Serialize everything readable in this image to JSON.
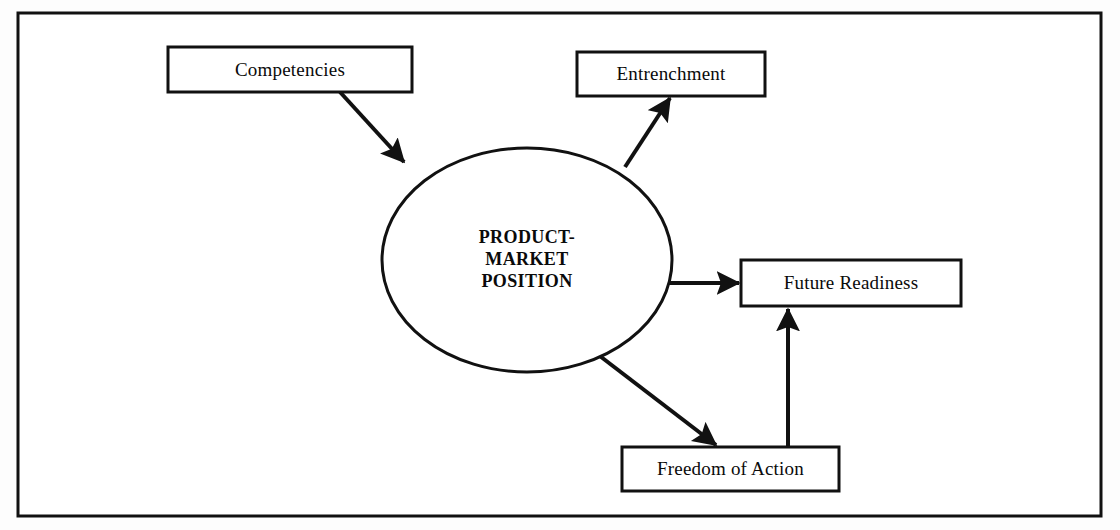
{
  "diagram": {
    "frame": {
      "name": "outer-border",
      "x": 18,
      "y": 13,
      "width": 1083,
      "height": 503,
      "stroke": "#111111",
      "stroke_width": 3,
      "fill": "#ffffff"
    },
    "colors": {
      "stroke": "#111111",
      "fill": "#ffffff",
      "text": "#0a0a0a",
      "background": "#fdfdfd"
    },
    "center_node": {
      "id": "product-market-position",
      "shape": "ellipse",
      "label": "PRODUCT-\nMARKET\nPOSITION",
      "cx": 527,
      "cy": 260,
      "rx": 145,
      "ry": 112,
      "stroke_width": 3
    },
    "boxes": [
      {
        "id": "competencies",
        "label": "Competencies",
        "x": 168,
        "y": 47,
        "width": 244,
        "height": 45,
        "stroke_width": 3
      },
      {
        "id": "entrenchment",
        "label": "Entrenchment",
        "x": 577,
        "y": 52,
        "width": 188,
        "height": 44,
        "stroke_width": 3
      },
      {
        "id": "future-readiness",
        "label": "Future Readiness",
        "x": 741,
        "y": 260,
        "width": 220,
        "height": 46,
        "stroke_width": 3
      },
      {
        "id": "freedom-of-action",
        "label": "Freedom of Action",
        "x": 622,
        "y": 447,
        "width": 217,
        "height": 44,
        "stroke_width": 3
      }
    ],
    "arrows": [
      {
        "id": "competencies-to-position",
        "from": "competencies",
        "to": "product-market-position",
        "x1": 340,
        "y1": 92,
        "x2": 404,
        "y2": 162,
        "stroke_width": 4
      },
      {
        "id": "position-to-entrenchment",
        "from": "product-market-position",
        "to": "entrenchment",
        "x1": 625,
        "y1": 167,
        "x2": 670,
        "y2": 98,
        "stroke_width": 4
      },
      {
        "id": "position-to-future-readiness",
        "from": "product-market-position",
        "to": "future-readiness",
        "x1": 668,
        "y1": 283,
        "x2": 739,
        "y2": 283,
        "stroke_width": 4
      },
      {
        "id": "position-to-freedom-of-action",
        "from": "product-market-position",
        "to": "freedom-of-action",
        "x1": 592,
        "y1": 350,
        "x2": 716,
        "y2": 445,
        "stroke_width": 4
      },
      {
        "id": "freedom-of-action-to-future-readiness",
        "from": "freedom-of-action",
        "to": "future-readiness",
        "x1": 788,
        "y1": 446,
        "x2": 788,
        "y2": 309,
        "stroke_width": 4
      }
    ]
  }
}
